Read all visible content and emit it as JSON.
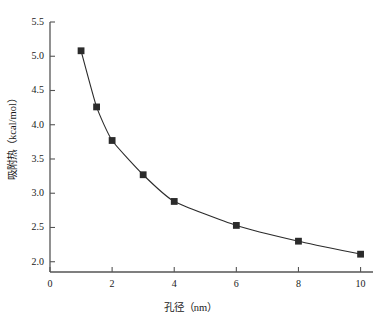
{
  "chart_data": {
    "type": "line",
    "title": "",
    "subtitle": "",
    "xlabel": "孔径（nm）",
    "ylabel": "吸附热（kcal/mol）",
    "xlim": [
      0,
      10.4
    ],
    "ylim": [
      1.85,
      5.5
    ],
    "xticks": [
      0,
      2,
      4,
      6,
      8,
      10
    ],
    "xtick_labels": [
      "0",
      "2",
      "4",
      "6",
      "8",
      "10"
    ],
    "yticks": [
      2.0,
      2.5,
      3.0,
      3.5,
      4.0,
      4.5,
      5.0,
      5.5
    ],
    "ytick_labels": [
      "2.0",
      "2.5",
      "3.0",
      "3.5",
      "4.0",
      "4.5",
      "5.0",
      "5.5"
    ],
    "grid": false,
    "legend": null,
    "legend_position": "none",
    "series": [
      {
        "name": "吸附热",
        "marker": "square",
        "marker_color": "#2b2b2b",
        "line_color": "#2b2b2b",
        "x": [
          1,
          1.5,
          2,
          3,
          4,
          6,
          8,
          10
        ],
        "values": [
          5.08,
          4.26,
          3.77,
          3.27,
          2.88,
          2.53,
          2.3,
          2.11
        ]
      }
    ],
    "annotations": []
  },
  "axes": {
    "x_title": "孔径（nm）",
    "y_title": "吸附热（kcal/mol）"
  },
  "colors": {
    "axis": "#555555",
    "line": "#2b2b2b",
    "marker": "#2b2b2b",
    "background": "#ffffff",
    "text": "#1a1a1a"
  }
}
